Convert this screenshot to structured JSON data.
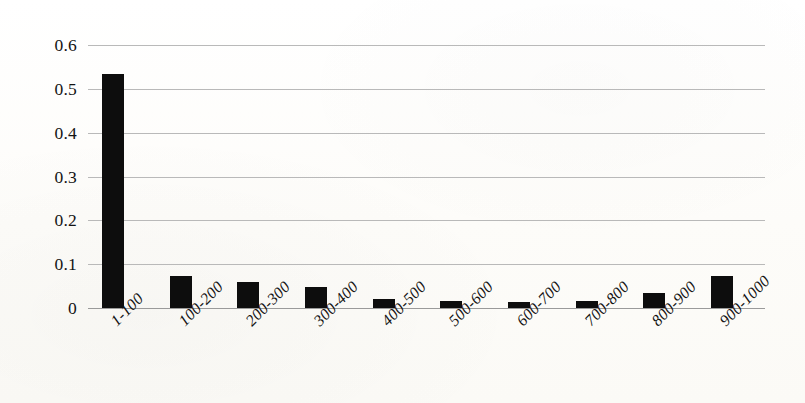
{
  "chart_data": {
    "type": "bar",
    "title": "",
    "subtitle": "",
    "xlabel": "",
    "ylabel": "",
    "categories": [
      "1-100",
      "100-200",
      "200-300",
      "300-400",
      "400-500",
      "500-600",
      "600-700",
      "700-800",
      "800-900",
      "900-1000"
    ],
    "values": [
      0.534,
      0.072,
      0.059,
      0.048,
      0.02,
      0.016,
      0.013,
      0.017,
      0.034,
      0.074
    ],
    "ylim": [
      0,
      0.6
    ],
    "ytick_labels": [
      "0.6",
      "0.5",
      "0.4",
      "0.3",
      "0.2",
      "0.1",
      "0"
    ],
    "ytick_values": [
      0.6,
      0.5,
      0.4,
      0.3,
      0.2,
      0.1,
      0
    ],
    "grid": true,
    "legend": false,
    "legend_position": "none",
    "bar_color": "#0d0d0d",
    "gridline_color": "#b9b9b9",
    "axis_color": "#9a9a9a",
    "background_color": "#fdfdfb",
    "xtick_rotation_deg": -45
  }
}
